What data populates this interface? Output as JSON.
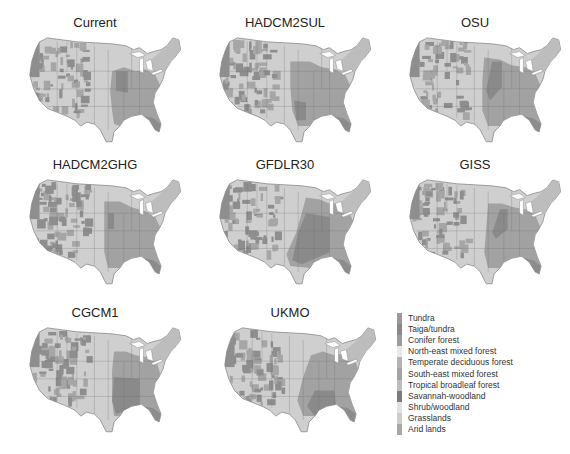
{
  "figure": {
    "type": "map-grid",
    "panels": [
      {
        "id": "current",
        "title": "Current"
      },
      {
        "id": "hadcm2sul",
        "title": "HADCM2SUL"
      },
      {
        "id": "osu",
        "title": "OSU"
      },
      {
        "id": "hadcm2ghg",
        "title": "HADCM2GHG"
      },
      {
        "id": "gfdlr30",
        "title": "GFDLR30"
      },
      {
        "id": "giss",
        "title": "GISS"
      },
      {
        "id": "cgcm1",
        "title": "CGCM1"
      },
      {
        "id": "ukmo",
        "title": "UKMO"
      }
    ]
  },
  "legend": {
    "items": [
      {
        "label": "Tundra",
        "color": "#9a9a9a"
      },
      {
        "label": "Taiga/tundra",
        "color": "#8a8a8a"
      },
      {
        "label": "Conifer forest",
        "color": "#9c9c9c"
      },
      {
        "label": "North-east mixed forest",
        "color": "#e8e8e8"
      },
      {
        "label": "Temperate deciduous forest",
        "color": "#b4b4b4"
      },
      {
        "label": "South-east mixed forest",
        "color": "#a4a4a4"
      },
      {
        "label": "Tropical broadleaf forest",
        "color": "#bdbdbd"
      },
      {
        "label": "Savannah-woodland",
        "color": "#7c7c7c"
      },
      {
        "label": "Shrub/woodland",
        "color": "#e2e2e2"
      },
      {
        "label": "Grasslands",
        "color": "#cdcdcd"
      },
      {
        "label": "Arid lands",
        "color": "#a8a8a8"
      }
    ]
  },
  "colors": {
    "land_base": "#cfcfcf",
    "west_conifer": "#8e8e8e",
    "east_forest": "#a2a2a2",
    "east_dark": "#8a8a8a",
    "northeast": "#bdbdbd",
    "border": "#6f6f6f"
  }
}
